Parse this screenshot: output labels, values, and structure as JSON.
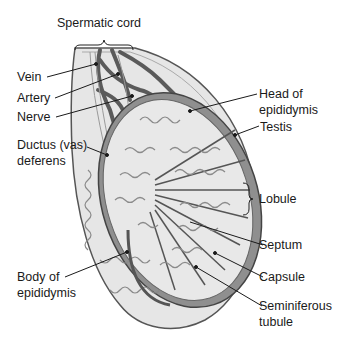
{
  "figure": {
    "labels": {
      "spermatic_cord": "Spermatic cord",
      "vein": "Vein",
      "artery": "Artery",
      "nerve": "Nerve",
      "ductus_line1": "Ductus (vas)",
      "ductus_line2": "deferens",
      "body_line1": "Body of",
      "body_line2": "epididymis",
      "head_line1": "Head of",
      "head_line2": "epididymis",
      "testis": "Testis",
      "lobule": "Lobule",
      "septum": "Septum",
      "capsule": "Capsule",
      "seminiferous_line1": "Seminiferous",
      "seminiferous_line2": "tubule"
    },
    "colors": {
      "background": "#ffffff",
      "outer_sheath": "#e4e4e4",
      "vessel": "#5a5a5a",
      "capsule": "#9a9a9a",
      "lobule_fill": "#d2d2d2",
      "tubule_stroke": "#8a8a8a",
      "leader": "#1a1a1a"
    }
  }
}
